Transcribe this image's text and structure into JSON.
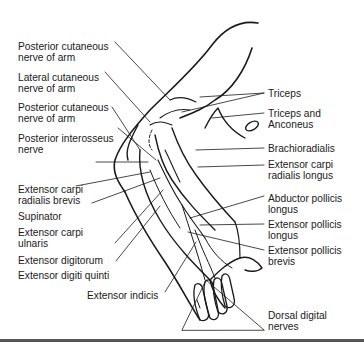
{
  "figure": {
    "type": "anatomical-line-drawing",
    "labels_left": [
      {
        "id": "post-cut-nerve-arm-1",
        "lines": [
          "Posterior cutaneous",
          "nerve of arm"
        ]
      },
      {
        "id": "lat-cut-nerve-arm",
        "lines": [
          "Lateral cutaneous",
          "nerve of arm"
        ]
      },
      {
        "id": "post-cut-nerve-arm-2",
        "lines": [
          "Posterior cutaneous",
          "nerve of arm"
        ]
      },
      {
        "id": "post-interosseus-nerve",
        "lines": [
          "Posterior interosseus",
          "nerve"
        ]
      },
      {
        "id": "ext-carpi-rad-brevis",
        "lines": [
          "Extensor carpi",
          "radialis brevis"
        ]
      },
      {
        "id": "supinator",
        "lines": [
          "Supinator"
        ]
      },
      {
        "id": "ext-carpi-ulnaris",
        "lines": [
          "Extensor carpi",
          "ulnaris"
        ]
      },
      {
        "id": "ext-digitorum",
        "lines": [
          "Extensor digitorum"
        ]
      },
      {
        "id": "ext-digiti-quinti",
        "lines": [
          "Extensor digiti quinti"
        ]
      },
      {
        "id": "ext-indicis",
        "lines": [
          "Extensor indicis"
        ]
      }
    ],
    "labels_right": [
      {
        "id": "triceps",
        "lines": [
          "Triceps"
        ]
      },
      {
        "id": "triceps-anconeus",
        "lines": [
          "Triceps and",
          "Anconeus"
        ]
      },
      {
        "id": "brachioradialis",
        "lines": [
          "Brachioradialis"
        ]
      },
      {
        "id": "ext-carpi-rad-longus",
        "lines": [
          "Extensor carpi",
          "radialis longus"
        ]
      },
      {
        "id": "abd-pollicis-longus",
        "lines": [
          "Abductor pollicis",
          "longus"
        ]
      },
      {
        "id": "ext-pollicis-longus",
        "lines": [
          "Extensor pollicis",
          "longus"
        ]
      },
      {
        "id": "ext-pollicis-brevis",
        "lines": [
          "Extensor pollicis",
          "brevis"
        ]
      },
      {
        "id": "dorsal-digital-nerves",
        "lines": [
          "Dorsal digital",
          "nerves"
        ]
      }
    ],
    "colors": {
      "ink": "#1a1a1a",
      "background": "#ffffff",
      "rule": "#555555"
    }
  }
}
